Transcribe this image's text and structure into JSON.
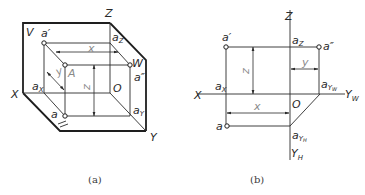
{
  "figure_a": {
    "caption": "(a)",
    "planes": {
      "V": "V",
      "W": "W",
      "H": "H"
    },
    "axes": {
      "X": "X",
      "Y": "Y",
      "Z": "Z",
      "O": "O"
    },
    "point_space": "A",
    "projections": {
      "front": "a",
      "front_mark": "′",
      "side": "a",
      "side_mark": "″",
      "top": "a"
    },
    "axis_points": {
      "ax_base": "a",
      "ax_sub": "X",
      "az_base": "a",
      "az_sub": "Z",
      "ay_base": "a",
      "ay_sub": "Y"
    },
    "dimensions": {
      "x": "x",
      "y": "y",
      "z": "z"
    }
  },
  "figure_b": {
    "caption": "(b)",
    "axes": {
      "X": "X",
      "Z": "Z",
      "O": "O",
      "YW_base": "Y",
      "YW_sub": "W",
      "YH_base": "Y",
      "YH_sub": "H"
    },
    "projections": {
      "front": "a",
      "front_mark": "′",
      "side": "a",
      "side_mark": "″",
      "top": "a"
    },
    "axis_points": {
      "ax_base": "a",
      "ax_sub": "X",
      "az_base": "a",
      "az_sub": "Z",
      "ayw_base": "a",
      "ayw_sub": "Y",
      "ayw_subsub": "W",
      "ayh_base": "a",
      "ayh_sub": "Y",
      "ayh_subsub": "H"
    },
    "dimensions": {
      "x": "x",
      "y": "y",
      "z": "z"
    }
  }
}
